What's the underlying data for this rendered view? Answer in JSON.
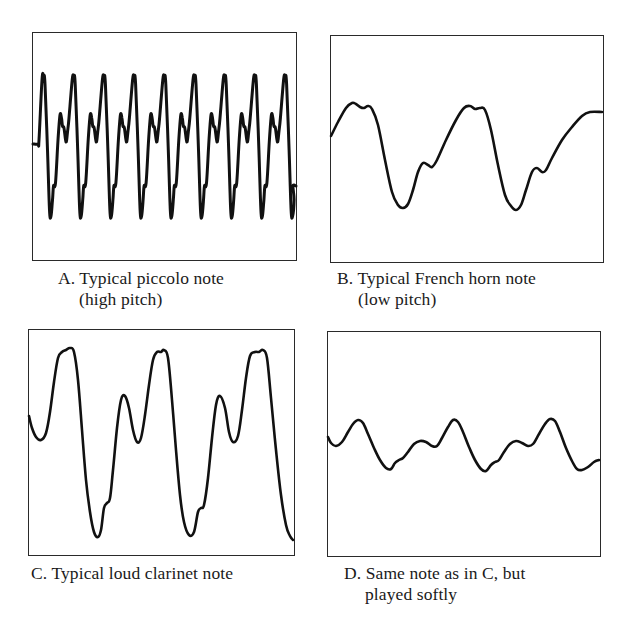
{
  "figure": {
    "panels": [
      {
        "id": "A",
        "caption_line1": "A. Typical piccolo note",
        "caption_line2": "(high pitch)",
        "frame": {
          "x": 32,
          "y": 32,
          "w": 265,
          "h": 229
        },
        "caption_pos": {
          "x": 58,
          "y": 268
        }
      },
      {
        "id": "B",
        "caption_line1": "B. Typical French horn note",
        "caption_line2": "(low pitch)",
        "frame": {
          "x": 330,
          "y": 35,
          "w": 274,
          "h": 228
        },
        "caption_pos": {
          "x": 337,
          "y": 268
        }
      },
      {
        "id": "C",
        "caption_line1": "C. Typical loud clarinet note",
        "caption_line2": "",
        "frame": {
          "x": 28,
          "y": 329,
          "w": 267,
          "h": 227
        },
        "caption_pos": {
          "x": 31,
          "y": 563
        }
      },
      {
        "id": "D",
        "caption_line1": "D. Same note as in C, but",
        "caption_line2": "played softly",
        "frame": {
          "x": 327,
          "y": 331,
          "w": 274,
          "h": 226
        },
        "caption_pos": {
          "x": 344,
          "y": 563
        }
      }
    ]
  },
  "chart_data": [
    {
      "type": "line",
      "title": "A. Typical piccolo note (high pitch)",
      "xlabel": "",
      "ylabel": "",
      "grid": false,
      "description": "Waveform with ~9 short cycles across the frame; sharp peaks near top, deep troughs, small shoulder after each trough",
      "cycles": 9,
      "relative_amplitude": 1.0,
      "x": [
        0,
        0.25,
        0.5,
        0.75,
        1.0
      ],
      "values": [
        0,
        1.0,
        -1.0,
        0.45,
        0
      ]
    },
    {
      "type": "line",
      "title": "B. Typical French horn note (low pitch)",
      "xlabel": "",
      "ylabel": "",
      "grid": false,
      "description": "Slow waveform with ~2 cycles; rounded double-bump peak, deep trough, small shoulder on rise",
      "cycles": 2,
      "relative_amplitude": 0.75,
      "x": [
        0,
        0.2,
        0.35,
        0.55,
        0.7,
        0.8,
        1.0
      ],
      "values": [
        0.3,
        1.0,
        0.9,
        -1.0,
        -0.35,
        -0.45,
        0.3
      ]
    },
    {
      "type": "line",
      "title": "C. Typical loud clarinet note",
      "xlabel": "",
      "ylabel": "",
      "grid": false,
      "description": "Large-amplitude waveform ~2.5 cycles; tall flat-topped main peak, secondary peak, deep trough with small kink",
      "cycles": 2.5,
      "relative_amplitude": 1.0,
      "x": [
        0,
        0.15,
        0.35,
        0.65,
        0.8,
        0.9,
        1.0
      ],
      "values": [
        0.1,
        1.0,
        -1.0,
        -0.7,
        0.55,
        0.05,
        0.1
      ]
    },
    {
      "type": "line",
      "title": "D. Same note as in C, but played softly",
      "xlabel": "",
      "ylabel": "",
      "grid": false,
      "description": "Same pitch as C but much smaller amplitude and smoother shape, ~2.7 cycles",
      "cycles": 2.7,
      "relative_amplitude": 0.3,
      "x": [
        0,
        0.25,
        0.55,
        0.7,
        0.85,
        1.0
      ],
      "values": [
        0.1,
        1.0,
        -1.0,
        -0.6,
        0.4,
        0.1
      ]
    }
  ]
}
